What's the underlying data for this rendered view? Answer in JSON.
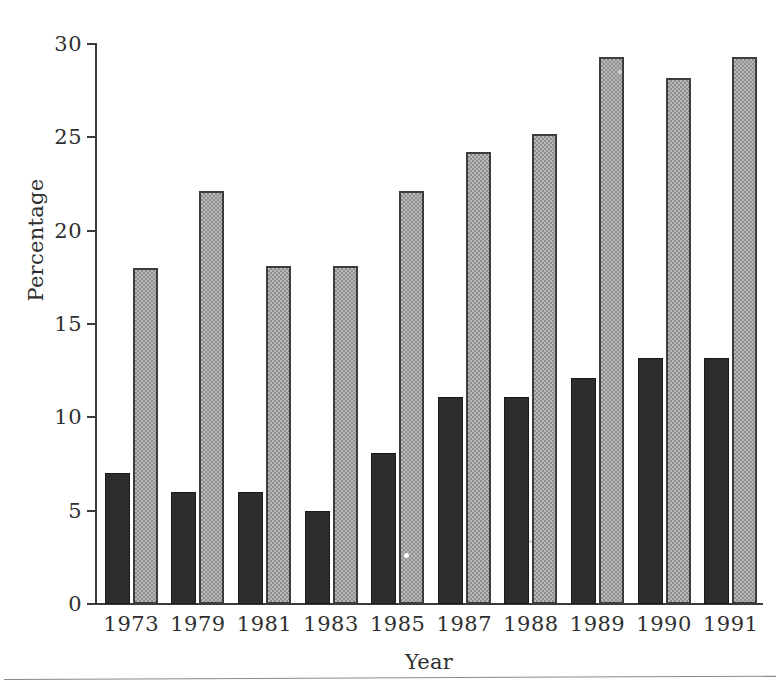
{
  "chart_data": {
    "type": "bar",
    "title": "",
    "xlabel": "Year",
    "ylabel": "Percentage",
    "categories": [
      "1973",
      "1979",
      "1981",
      "1983",
      "1985",
      "1987",
      "1988",
      "1989",
      "1990",
      "1991"
    ],
    "series": [
      {
        "name": "dark-series",
        "color": "#2c2c2c",
        "values": [
          7.0,
          6.0,
          6.0,
          5.0,
          8.1,
          11.1,
          11.1,
          12.1,
          13.2,
          13.2
        ]
      },
      {
        "name": "light-series",
        "color": "#b9b9b9",
        "values": [
          18.0,
          22.1,
          18.1,
          18.1,
          22.1,
          24.2,
          25.2,
          29.3,
          28.2,
          29.3
        ]
      }
    ],
    "ylim": [
      0,
      30
    ],
    "yticks": [
      0,
      5,
      10,
      15,
      20,
      25,
      30
    ],
    "ytick_labels": [
      "0",
      "5",
      "10",
      "15",
      "20",
      "25",
      "30"
    ],
    "grid": false,
    "legend": "none"
  }
}
